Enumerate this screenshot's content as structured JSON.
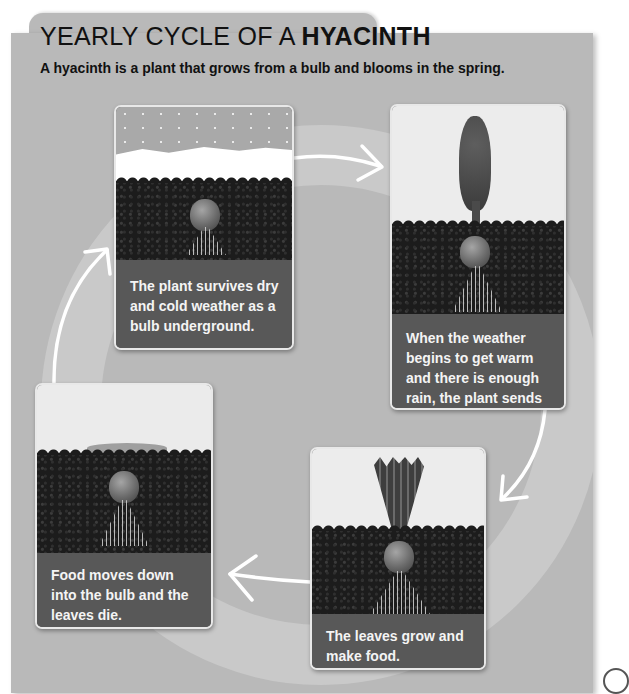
{
  "header": {
    "title_prefix": "YEARLY CYCLE OF A ",
    "title_emphasis": "HYACINTH",
    "subtitle": "A hyacinth is a plant that grows from a bulb and blooms in the spring."
  },
  "colors": {
    "panel_bg": "#b9b9b9",
    "ring": "#c9c9c9",
    "card_label_bg": "#585858",
    "card_label_text": "#f4f4f4",
    "arrow": "#ffffff",
    "soil": "#1c1c1c"
  },
  "cycle": {
    "stages": [
      {
        "id": "dormant",
        "position": "top-left",
        "image_icon": "bulb-under-snow-icon",
        "caption": "The plant survives dry and cold weather as a bulb underground."
      },
      {
        "id": "bloom",
        "position": "top-right",
        "image_icon": "hyacinth-flower-icon",
        "caption": "When the weather begins to get warm and there is enough rain, the plant sends up flowers."
      },
      {
        "id": "leaves",
        "position": "bottom-right",
        "image_icon": "leaves-sprouting-icon",
        "caption": "The leaves grow and make food."
      },
      {
        "id": "dieback",
        "position": "bottom-left",
        "image_icon": "wilted-leaves-icon",
        "caption": "Food moves down into the bulb and the leaves die."
      }
    ],
    "arrows": [
      {
        "from": "dormant",
        "to": "bloom",
        "direction": "right"
      },
      {
        "from": "bloom",
        "to": "leaves",
        "direction": "down-left"
      },
      {
        "from": "leaves",
        "to": "dieback",
        "direction": "left"
      },
      {
        "from": "dieback",
        "to": "dormant",
        "direction": "up-right"
      }
    ]
  }
}
